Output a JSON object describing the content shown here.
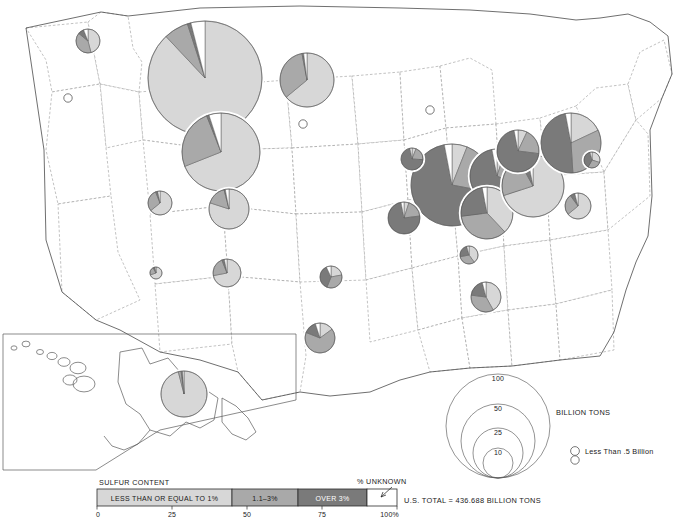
{
  "legend": {
    "heading": "SULFUR CONTENT",
    "unknown_label": "% UNKNOWN",
    "total_label": "U.S. TOTAL = 436.688 BILLION TONS",
    "classes": [
      {
        "name": "low",
        "label": "LESS THAN OR EQUAL TO 1%",
        "color": "#d7d7d7",
        "from": 0,
        "to": 45
      },
      {
        "name": "medium",
        "label": "1.1–3%",
        "color": "#a9a9a9",
        "from": 45,
        "to": 67
      },
      {
        "name": "high",
        "label": "OVER 3%",
        "color": "#7a7a7a",
        "from": 67,
        "to": 90
      },
      {
        "name": "unknown",
        "label": "",
        "color": "#ffffff",
        "from": 90,
        "to": 100
      }
    ],
    "axis_ticks": [
      "0",
      "25",
      "50",
      "75",
      "100%"
    ]
  },
  "size_legend": {
    "unit_label": "BILLION TONS",
    "rings": [
      "100",
      "50",
      "25",
      "10"
    ],
    "small_note": "Less Than .5 Billion"
  },
  "chart_data": {
    "type": "pie",
    "value_unit": "billion tons",
    "total": 436.688,
    "categories": [
      "LESS THAN OR EQUAL TO 1%",
      "1.1-3%",
      "OVER 3%",
      "% UNKNOWN"
    ],
    "category_colors": [
      "#d7d7d7",
      "#a9a9a9",
      "#7a7a7a",
      "#ffffff"
    ],
    "pies": [
      {
        "state": "Montana",
        "cx": 205,
        "cy": 78,
        "r": 57,
        "values": [
          88,
          7,
          1,
          4
        ]
      },
      {
        "state": "Wyoming",
        "cx": 221,
        "cy": 152,
        "r": 39,
        "values": [
          69,
          25,
          1,
          5
        ]
      },
      {
        "state": "North Dakota",
        "cx": 307,
        "cy": 80,
        "r": 27,
        "values": [
          64,
          33,
          1,
          2
        ]
      },
      {
        "state": "Washington",
        "cx": 88,
        "cy": 41,
        "r": 12,
        "values": [
          46,
          40,
          8,
          6
        ]
      },
      {
        "state": "Utah",
        "cx": 160,
        "cy": 203,
        "r": 12,
        "values": [
          64,
          30,
          3,
          3
        ]
      },
      {
        "state": "Colorado",
        "cx": 229,
        "cy": 209,
        "r": 20,
        "values": [
          80,
          16,
          1,
          3
        ]
      },
      {
        "state": "Arizona",
        "cx": 156,
        "cy": 273,
        "r": 6,
        "values": [
          70,
          22,
          5,
          3
        ]
      },
      {
        "state": "New Mexico",
        "cx": 227,
        "cy": 273,
        "r": 14,
        "values": [
          72,
          22,
          3,
          3
        ]
      },
      {
        "state": "Oklahoma",
        "cx": 331,
        "cy": 277,
        "r": 11,
        "values": [
          22,
          34,
          37,
          7
        ]
      },
      {
        "state": "Texas",
        "cx": 320,
        "cy": 338,
        "r": 15,
        "values": [
          15,
          66,
          14,
          5
        ]
      },
      {
        "state": "Illinois",
        "cx": 452,
        "cy": 185,
        "r": 41,
        "values": [
          6,
          22,
          69,
          3
        ]
      },
      {
        "state": "Indiana",
        "cx": 497,
        "cy": 176,
        "r": 27,
        "values": [
          5,
          27,
          65,
          3
        ]
      },
      {
        "state": "Kentucky",
        "cx": 487,
        "cy": 213,
        "r": 26,
        "values": [
          38,
          35,
          24,
          3
        ]
      },
      {
        "state": "West Virginia",
        "cx": 533,
        "cy": 186,
        "r": 31,
        "values": [
          70,
          22,
          5,
          3
        ]
      },
      {
        "state": "Pennsylvania",
        "cx": 571,
        "cy": 143,
        "r": 30,
        "values": [
          18,
          31,
          48,
          3
        ]
      },
      {
        "state": "Ohio",
        "cx": 518,
        "cy": 151,
        "r": 21,
        "values": [
          7,
          20,
          70,
          3
        ]
      },
      {
        "state": "Virginia",
        "cx": 578,
        "cy": 206,
        "r": 13,
        "values": [
          64,
          26,
          6,
          4
        ]
      },
      {
        "state": "Maryland",
        "cx": 592,
        "cy": 160,
        "r": 8,
        "values": [
          30,
          28,
          38,
          4
        ]
      },
      {
        "state": "Missouri",
        "cx": 404,
        "cy": 218,
        "r": 16,
        "values": [
          5,
          18,
          74,
          3
        ]
      },
      {
        "state": "Iowa",
        "cx": 412,
        "cy": 159,
        "r": 11,
        "values": [
          6,
          20,
          71,
          3
        ]
      },
      {
        "state": "Tennessee",
        "cx": 469,
        "cy": 255,
        "r": 9,
        "values": [
          40,
          32,
          24,
          4
        ]
      },
      {
        "state": "Alabama",
        "cx": 486,
        "cy": 297,
        "r": 15,
        "values": [
          42,
          35,
          19,
          4
        ]
      },
      {
        "state": "Alaska",
        "cx": 184,
        "cy": 394,
        "r": 23,
        "values": [
          96,
          2,
          1,
          1
        ]
      }
    ],
    "small_markers": [
      {
        "state": "Nevada",
        "cx": 68,
        "cy": 98
      },
      {
        "state": "Nebraska",
        "cx": 303,
        "cy": 124
      },
      {
        "state": "Michigan",
        "cx": 430,
        "cy": 110
      },
      {
        "state": "Georgia",
        "cx": 575,
        "cy": 460
      }
    ]
  }
}
